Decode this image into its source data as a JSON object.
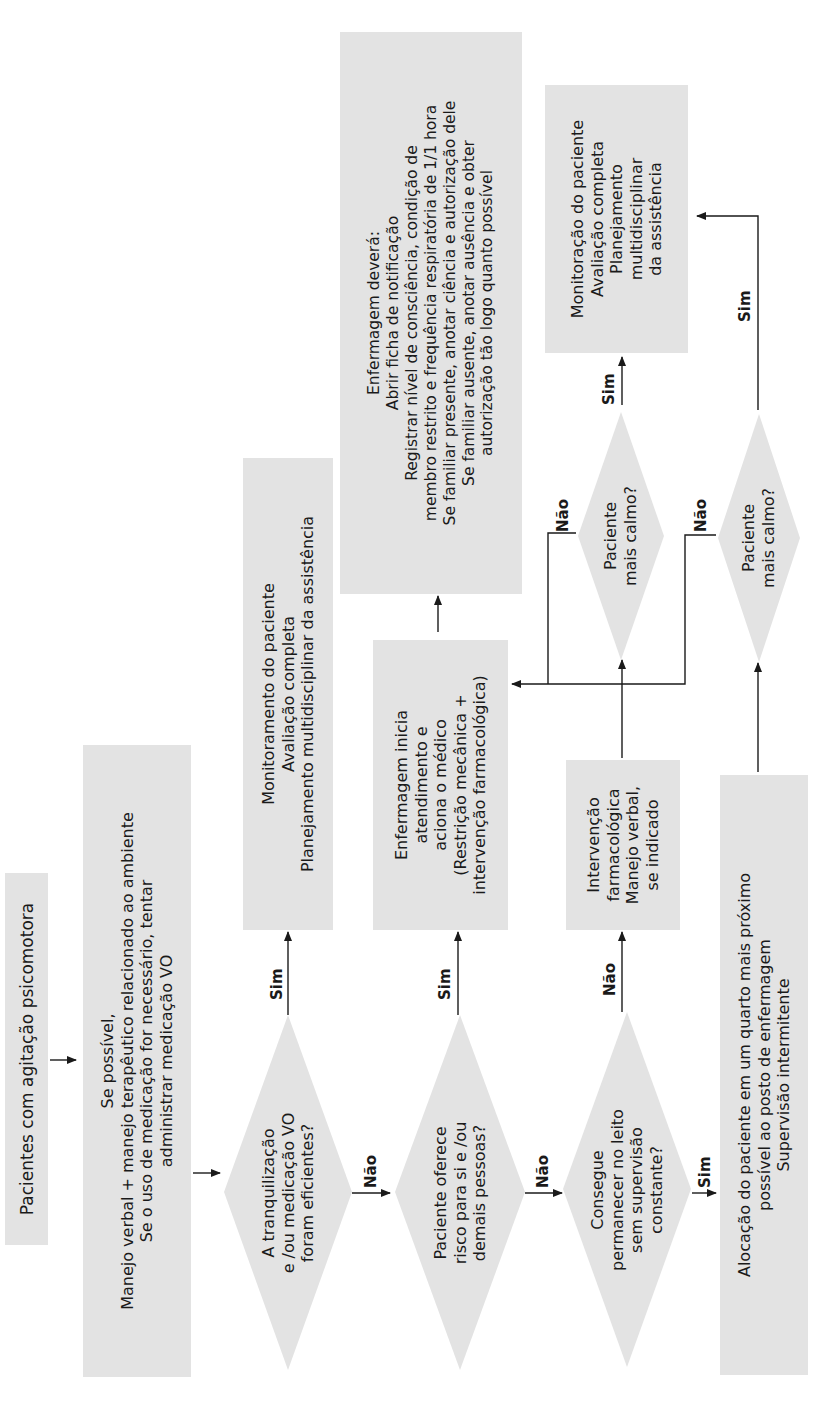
{
  "diagram": {
    "type": "flowchart",
    "orientation": "rotated-90-ccw",
    "fill_color": "#e3e3e3",
    "line_color": "#1a1a1a",
    "nodes": {
      "start": {
        "text": "Pacientes com agitação psicomotora"
      },
      "verbal": {
        "text": "Se possível,\nManejo verbal + manejo terapêutico relacionado ao ambiente\nSe o uso de medicação for necessário, tentar\nadministrar medicação VO"
      },
      "q_efficient": {
        "text": "A tranquilização\ne /ou medicação VO\nforam eficientes?"
      },
      "monitor1": {
        "text": "Monitoramento do paciente\nAvaliação completa\nPlanejamento multidisciplinar da assistência"
      },
      "q_risk": {
        "text": "Paciente oferece\nrisco para si e /ou\ndemais pessoas?"
      },
      "nursing_start": {
        "text": "Enfermagem inicia\natendimento e\naciona o médico\n(Restrição mecânica +\nintervenção farmacológica)"
      },
      "nursing_must": {
        "text": "Enfermagem deverá:\nAbrir ficha de notificação\nRegistrar nível de consciência, condição de\nmembro restrito e frequência respiratória de 1/1 hora\nSe familiar presente, anotar ciência e autorização dele\nSe familiar ausente, anotar ausência e obter\nautorização tão logo quanto possível"
      },
      "q_bed": {
        "text": "Consegue\npermanecer no leito\nsem supervisão\nconstante?"
      },
      "pharma": {
        "text": "Intervenção\nfarmacológica\nManejo verbal,\nse indicado"
      },
      "q_calm1": {
        "text": "Paciente\nmais calmo?"
      },
      "allocation": {
        "text": "Alocação do paciente em um quarto mais próximo\npossível ao posto de enfermagem\nSupervisão intermitente"
      },
      "q_calm2": {
        "text": "Paciente\nmais calmo?"
      },
      "monitor2": {
        "text": "Monitoração do paciente\nAvaliação completa\nPlanejamento\nmultidisciplinar\nda assistência"
      }
    },
    "edge_labels": {
      "q_efficient_yes": "Sim",
      "q_efficient_no": "Não",
      "q_risk_yes": "Sim",
      "q_risk_no": "Não",
      "q_bed_no": "Não",
      "q_bed_yes": "Sim",
      "q_calm1_yes": "Sim",
      "q_calm1_no": "Não",
      "q_calm2_yes": "Sim",
      "q_calm2_no": "Não"
    }
  }
}
